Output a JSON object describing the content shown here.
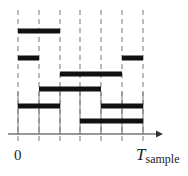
{
  "diagram": {
    "type": "timing",
    "grid_x": [
      18,
      39,
      60,
      80,
      101,
      122,
      143
    ],
    "axis": {
      "y": 134,
      "x_start": 8,
      "x_end": 163
    },
    "bars": [
      {
        "row": 1,
        "y": 31,
        "x1": 18,
        "x2": 60
      },
      {
        "row": 2,
        "y": 58,
        "x1": 18,
        "x2": 39
      },
      {
        "row": 2,
        "y": 58,
        "x1": 122,
        "x2": 143
      },
      {
        "row": 3,
        "y": 74,
        "x1": 60,
        "x2": 122
      },
      {
        "row": 4,
        "y": 89,
        "x1": 39,
        "x2": 101
      },
      {
        "row": 5,
        "y": 106,
        "x1": 18,
        "x2": 60
      },
      {
        "row": 5,
        "y": 106,
        "x1": 101,
        "x2": 143
      },
      {
        "row": 6,
        "y": 121,
        "x1": 80,
        "x2": 143
      }
    ],
    "labels": {
      "origin": "0",
      "end_main": "T",
      "end_sub": "sample"
    },
    "colors": {
      "bar": "#111111",
      "grid": "#777777",
      "axis": "#333333"
    }
  }
}
